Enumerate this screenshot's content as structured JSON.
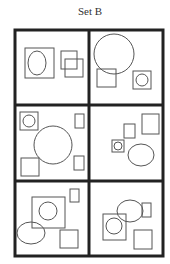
{
  "title": "Set B",
  "colors": {
    "frame": "#222222",
    "shape": "#555555",
    "background": "#ffffff"
  },
  "grid": {
    "rows": 3,
    "cols": 2
  },
  "cells": [
    {
      "id": 1,
      "shapes": [
        "large square containing ellipse",
        "two overlapping small squares"
      ]
    },
    {
      "id": 2,
      "shapes": [
        "large circle overlapping small square",
        "small square containing circle"
      ]
    },
    {
      "id": 3,
      "shapes": [
        "small square containing circle",
        "large circle",
        "square",
        "two small rectangles"
      ]
    },
    {
      "id": 4,
      "shapes": [
        "square",
        "small rectangle",
        "small square containing circle",
        "ellipse"
      ]
    },
    {
      "id": 5,
      "shapes": [
        "square containing circle",
        "ellipse",
        "square",
        "small rectangle"
      ]
    },
    {
      "id": 6,
      "shapes": [
        "ellipse overlapping small square",
        "square containing circle",
        "square"
      ]
    }
  ]
}
